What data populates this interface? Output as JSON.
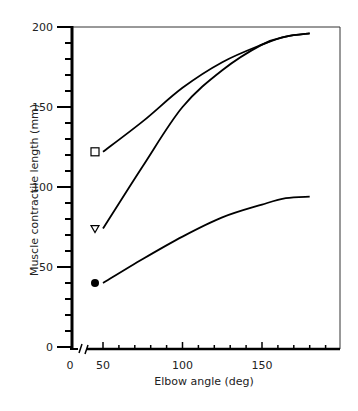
{
  "chart_data": {
    "type": "line",
    "title": "",
    "xlabel": "Elbow angle (deg)",
    "ylabel": "Muscle contractile length (mm)",
    "xlim": [
      0,
      190
    ],
    "ylim": [
      0,
      200
    ],
    "x_axis_break": true,
    "xticks_labeled": [
      0,
      50,
      100,
      150
    ],
    "yticks_labeled": [
      0,
      50,
      100,
      150,
      200
    ],
    "x_minor_step": 10,
    "y_minor_step": 10,
    "grid": false,
    "legend": "none (markers at curve start)",
    "series": [
      {
        "name": "square",
        "marker": "open-square",
        "x": [
          50,
          75,
          100,
          125,
          150,
          165,
          180
        ],
        "y": [
          122,
          141,
          162,
          178,
          189,
          194,
          196
        ]
      },
      {
        "name": "triangle",
        "marker": "open-triangle-down",
        "x": [
          50,
          75,
          100,
          125,
          150,
          165,
          180
        ],
        "y": [
          74,
          113,
          150,
          173,
          189,
          194,
          196
        ]
      },
      {
        "name": "circle",
        "marker": "filled-circle",
        "x": [
          50,
          75,
          100,
          125,
          150,
          165,
          180
        ],
        "y": [
          40,
          55,
          69,
          81,
          89,
          93,
          94
        ]
      }
    ]
  },
  "axis": {
    "x_title": "Elbow angle (deg)",
    "y_title": "Muscle contractile length (mm)",
    "x_labels": [
      "0",
      "50",
      "100",
      "150"
    ],
    "y_labels": [
      "0",
      "50",
      "100",
      "150",
      "200"
    ]
  }
}
